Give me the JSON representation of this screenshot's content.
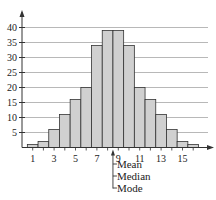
{
  "chart_data": {
    "type": "bar",
    "title": "",
    "xlabel": "",
    "ylabel": "",
    "categories": [
      1,
      2,
      3,
      4,
      5,
      6,
      7,
      8,
      9,
      10,
      11,
      12,
      13,
      14,
      15,
      16
    ],
    "values": [
      1,
      2,
      6,
      11,
      16,
      20,
      34,
      39,
      39,
      34,
      20,
      16,
      11,
      6,
      2,
      1
    ],
    "x_tick_labels": [
      "1",
      "3",
      "5",
      "7",
      "9",
      "11",
      "13",
      "15"
    ],
    "x_tick_values": [
      1,
      3,
      5,
      7,
      9,
      11,
      13,
      15
    ],
    "y_tick_labels": [
      "5",
      "10",
      "15",
      "20",
      "25",
      "30",
      "35",
      "40"
    ],
    "y_tick_values": [
      5,
      10,
      15,
      20,
      25,
      30,
      35,
      40
    ],
    "ylim": [
      0,
      44
    ],
    "xlim": [
      0,
      17.5
    ],
    "grid": "horizontal",
    "legend": null,
    "annotations": [
      {
        "x": 8.5,
        "text": "Mean"
      },
      {
        "x": 8.5,
        "text": "Median"
      },
      {
        "x": 8.5,
        "text": "Mode"
      }
    ],
    "colors": {
      "bar_fill": "#d0d0d0",
      "bar_stroke": "#333333",
      "grid": "#b8b8b8",
      "axis": "#333333"
    }
  }
}
